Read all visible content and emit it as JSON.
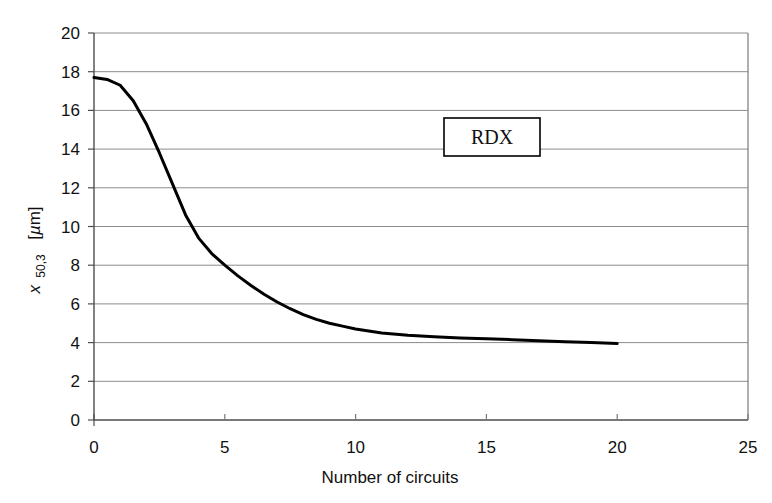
{
  "chart_data": {
    "type": "line",
    "title": "",
    "xlabel": "Number of circuits",
    "ylabel": "x 50,3  [µm]",
    "ylabel_parts": {
      "symbol": "x",
      "subscript": "50,3",
      "unit": "[µm]",
      "unit_bracket_open": "[",
      "unit_mu": "µ",
      "unit_m": "m",
      "unit_bracket_close": "]"
    },
    "xlim": [
      0,
      25
    ],
    "ylim": [
      0,
      20
    ],
    "xticks": [
      0,
      5,
      10,
      15,
      20,
      25
    ],
    "yticks": [
      0,
      2,
      4,
      6,
      8,
      10,
      12,
      14,
      16,
      18,
      20
    ],
    "xtick_labels": [
      "0",
      "5",
      "10",
      "15",
      "20",
      "25"
    ],
    "ytick_labels": [
      "0",
      "2",
      "4",
      "6",
      "8",
      "10",
      "12",
      "14",
      "16",
      "18",
      "20"
    ],
    "grid": "horizontal",
    "grid_color": "#8c8c8c",
    "axis_color": "#4d4d4d",
    "series": [
      {
        "name": "RDX",
        "color": "#000000",
        "line_width": 3,
        "x": [
          0,
          0.5,
          1,
          1.5,
          2,
          2.5,
          3,
          3.5,
          4,
          4.5,
          5,
          5.5,
          6,
          6.5,
          7,
          7.5,
          8,
          8.5,
          9,
          9.5,
          10,
          11,
          12,
          13,
          14,
          15,
          16,
          17,
          18,
          19,
          20
        ],
        "y": [
          17.7,
          17.6,
          17.3,
          16.5,
          15.3,
          13.8,
          12.2,
          10.6,
          9.4,
          8.6,
          8.0,
          7.45,
          6.95,
          6.5,
          6.1,
          5.75,
          5.45,
          5.2,
          5.0,
          4.85,
          4.7,
          4.5,
          4.38,
          4.3,
          4.24,
          4.2,
          4.15,
          4.1,
          4.05,
          4.0,
          3.95
        ]
      }
    ],
    "legend": {
      "label": "RDX",
      "position": "inside-top-center",
      "border_color": "#000000",
      "background": "#ffffff"
    }
  }
}
